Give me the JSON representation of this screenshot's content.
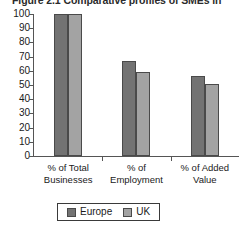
{
  "chart_data": {
    "type": "bar",
    "title": "Figure 2.1  Comparative profiles of SMEs in",
    "xlabel": "",
    "ylabel": "",
    "ylim": [
      0,
      100
    ],
    "yticks": [
      100,
      90,
      80,
      70,
      60,
      50,
      40,
      30,
      20,
      10,
      0
    ],
    "grid": false,
    "legend_position": "bottom-center",
    "categories": [
      "% of Total Businesses",
      "% of Employment",
      "% of Added Value"
    ],
    "category_lines": [
      [
        "% of Total",
        "Businesses"
      ],
      [
        "% of",
        "Employment"
      ],
      [
        "% of Added",
        "Value"
      ]
    ],
    "series": [
      {
        "name": "Europe",
        "color": "#737373",
        "values": [
          100,
          67,
          56
        ]
      },
      {
        "name": "UK",
        "color": "#a3a3a3",
        "values": [
          100,
          59,
          51
        ]
      }
    ]
  }
}
